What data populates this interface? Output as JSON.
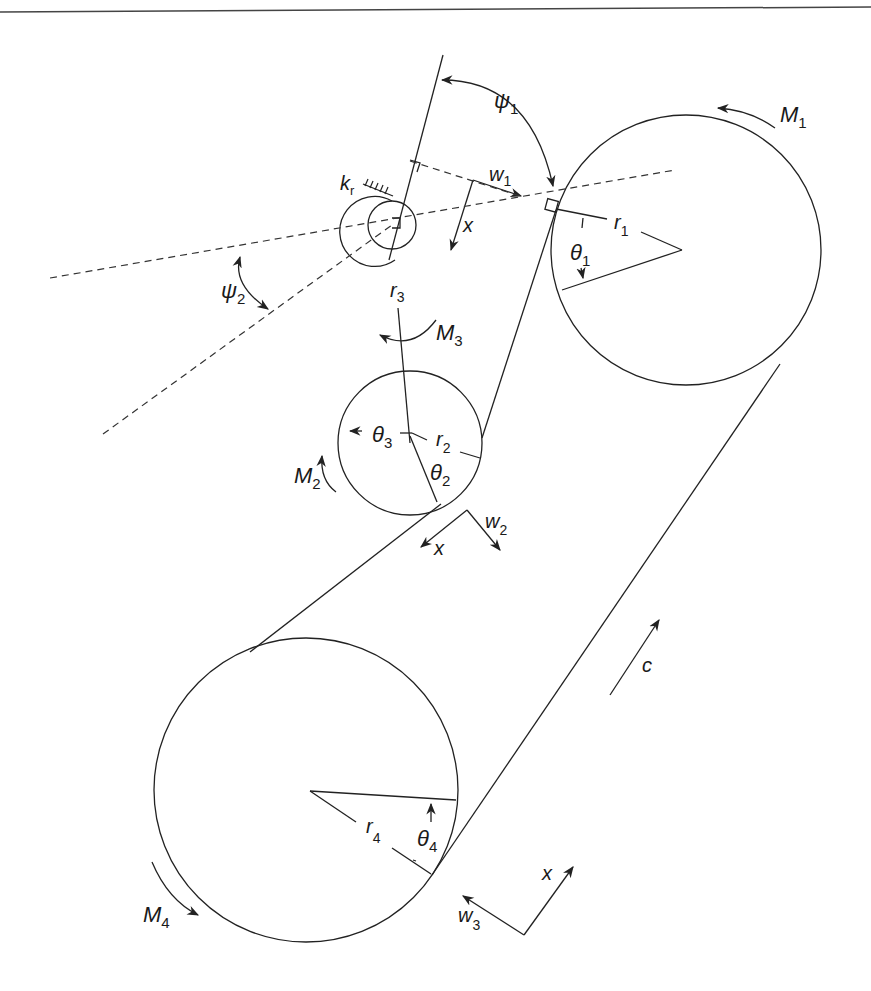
{
  "figure": {
    "colors": {
      "line": "#222222",
      "dash": "#333333",
      "background": "#ffffff"
    }
  },
  "labels": {
    "psi1": {
      "sym": "ψ",
      "sub": "1"
    },
    "psi2": {
      "sym": "ψ",
      "sub": "2"
    },
    "kr": {
      "sym": "k",
      "sub": "r"
    },
    "w1": {
      "sym": "w",
      "sub": "1"
    },
    "x1": {
      "sym": "x"
    },
    "M1": {
      "sym": "M",
      "sub": "1"
    },
    "r1": {
      "sym": "r",
      "sub": "1"
    },
    "theta1": {
      "sym": "θ",
      "sub": "1"
    },
    "r3": {
      "sym": "r",
      "sub": "3"
    },
    "M3": {
      "sym": "M",
      "sub": "3"
    },
    "theta3": {
      "sym": "θ",
      "sub": "3"
    },
    "r2": {
      "sym": "r",
      "sub": "2"
    },
    "theta2": {
      "sym": "θ",
      "sub": "2"
    },
    "M2": {
      "sym": "M",
      "sub": "2"
    },
    "x2": {
      "sym": "x"
    },
    "w2": {
      "sym": "w",
      "sub": "2"
    },
    "c": {
      "sym": "c"
    },
    "r4": {
      "sym": "r",
      "sub": "4"
    },
    "theta4": {
      "sym": "θ",
      "sub": "4"
    },
    "M4": {
      "sym": "M",
      "sub": "4"
    },
    "w3": {
      "sym": "w",
      "sub": "3"
    },
    "x3": {
      "sym": "x"
    }
  },
  "pulleys": [
    {
      "id": 1,
      "name": "pulley-1",
      "cx": 686,
      "cy": 250,
      "r": 135
    },
    {
      "id": 2,
      "name": "pulley-2",
      "cx": 410,
      "cy": 443,
      "r": 72
    },
    {
      "id": 3,
      "name": "tensioner-pivot",
      "cx": 392,
      "cy": 232,
      "r": 24
    },
    {
      "id": 4,
      "name": "pulley-4",
      "cx": 306,
      "cy": 790,
      "r": 152
    }
  ]
}
